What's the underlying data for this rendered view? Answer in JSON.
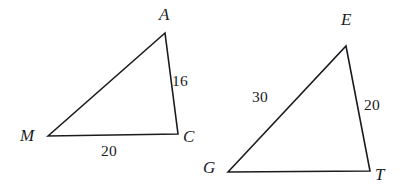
{
  "figure": {
    "type": "geometry-diagram",
    "canvas": {
      "width": 404,
      "height": 193
    },
    "background_color": "#ffffff",
    "stroke_color": "#1b1b1f",
    "text_color": "#1b1b1f",
    "stroke_width": 1.6
  },
  "triangles": [
    {
      "id": "triangle-mac",
      "name": "MAC",
      "vertices": [
        {
          "id": "vertex-m",
          "label": "M",
          "x": 48,
          "y": 136,
          "label_x": 20,
          "label_y": 127
        },
        {
          "id": "vertex-a",
          "label": "A",
          "x": 165,
          "y": 33,
          "label_x": 159,
          "label_y": 6
        },
        {
          "id": "vertex-c",
          "label": "C",
          "x": 178,
          "y": 134,
          "label_x": 183,
          "label_y": 128
        }
      ],
      "sides": [
        {
          "id": "side-ma",
          "from": "M",
          "to": "A",
          "length": "",
          "label_x": 0,
          "label_y": 0
        },
        {
          "id": "side-ac",
          "from": "A",
          "to": "C",
          "length": "16",
          "label_x": 172,
          "label_y": 73
        },
        {
          "id": "side-mc",
          "from": "M",
          "to": "C",
          "length": "20",
          "label_x": 101,
          "label_y": 143
        }
      ]
    },
    {
      "id": "triangle-get",
      "name": "GET",
      "vertices": [
        {
          "id": "vertex-g",
          "label": "G",
          "x": 228,
          "y": 172,
          "label_x": 203,
          "label_y": 159
        },
        {
          "id": "vertex-e",
          "label": "E",
          "x": 346,
          "y": 46,
          "label_x": 341,
          "label_y": 11
        },
        {
          "id": "vertex-t",
          "label": "T",
          "x": 370,
          "y": 171,
          "label_x": 375,
          "label_y": 166
        }
      ],
      "sides": [
        {
          "id": "side-ge",
          "from": "G",
          "to": "E",
          "length": "30",
          "label_x": 252,
          "label_y": 89
        },
        {
          "id": "side-et",
          "from": "E",
          "to": "T",
          "length": "20",
          "label_x": 364,
          "label_y": 97
        },
        {
          "id": "side-gt",
          "from": "G",
          "to": "T",
          "length": "",
          "label_x": 0,
          "label_y": 0
        }
      ]
    }
  ],
  "chart_data": {
    "type": "diagram",
    "title": "",
    "shapes": [
      {
        "shape": "triangle",
        "name": "MAC",
        "points": [
          [
            48,
            136
          ],
          [
            165,
            33
          ],
          [
            178,
            134
          ]
        ],
        "vertex_labels": [
          "M",
          "A",
          "C"
        ],
        "side_labels": {
          "AC": "16",
          "MC": "20",
          "MA": ""
        }
      },
      {
        "shape": "triangle",
        "name": "GET",
        "points": [
          [
            228,
            172
          ],
          [
            346,
            46
          ],
          [
            370,
            171
          ]
        ],
        "vertex_labels": [
          "G",
          "E",
          "T"
        ],
        "side_labels": {
          "GE": "30",
          "ET": "20",
          "GT": ""
        }
      }
    ],
    "annotations": [
      "16",
      "20",
      "30",
      "20"
    ]
  }
}
